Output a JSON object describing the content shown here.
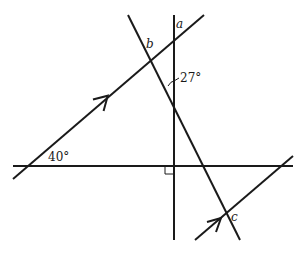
{
  "diagram": {
    "type": "geometry-parallel-lines-angles",
    "labels": {
      "a": "a",
      "b": "b",
      "c": "c",
      "angle_27": "27°",
      "angle_40": "40°"
    },
    "lines": [
      {
        "id": "horizontal",
        "description": "horizontal line",
        "x1": 13,
        "y1": 166,
        "x2": 293,
        "y2": 166
      },
      {
        "id": "vertical",
        "description": "vertical line perpendicular to horizontal",
        "x1": 174,
        "y1": 15,
        "x2": 174,
        "y2": 240
      },
      {
        "id": "parallel-upper",
        "description": "upper parallel line with arrow",
        "x1": 13,
        "y1": 179,
        "x2": 204,
        "y2": 15
      },
      {
        "id": "transversal",
        "description": "descending transversal",
        "x1": 128,
        "y1": 15,
        "x2": 240,
        "y2": 240
      },
      {
        "id": "parallel-lower",
        "description": "lower parallel line with arrow",
        "x1": 195,
        "y1": 240,
        "x2": 293,
        "y2": 156
      }
    ],
    "marks": {
      "right_angle": "right-angle mark at intersection of vertical and horizontal",
      "parallel_arrows": 2,
      "angle_arc_27": "arc between vertical line and transversal"
    },
    "color": "#1a1a1a"
  }
}
